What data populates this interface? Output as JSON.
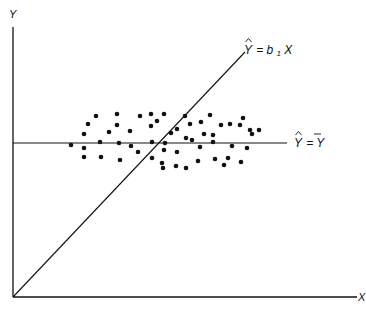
{
  "diagram": {
    "axes": {
      "y_label": "Y",
      "x_label": "X",
      "origin": [
        13,
        297
      ],
      "y_top": 27,
      "x_right": 362
    },
    "lines": [
      {
        "name": "regression-through-origin",
        "label_prefix": "Y",
        "label_eq": "= b",
        "label_sub": "1",
        "label_suffix": "X",
        "label_full": "Ŷ = b1X",
        "from": [
          13,
          297
        ],
        "to": [
          245,
          52
        ]
      },
      {
        "name": "mean-line",
        "label_prefix": "Y",
        "label_eq": "= ",
        "label_bar": "Y",
        "label_full": "Ŷ = Ȳ",
        "from": [
          13,
          143
        ],
        "to": [
          287,
          143
        ]
      }
    ],
    "stroke_color": "#111111",
    "point_color": "#111111",
    "point_radius": 2.3,
    "points": [
      [
        71,
        145
      ],
      [
        84,
        134
      ],
      [
        88,
        124
      ],
      [
        96,
        116
      ],
      [
        84,
        148
      ],
      [
        100,
        142
      ],
      [
        109,
        132
      ],
      [
        84,
        157
      ],
      [
        101,
        157
      ],
      [
        117,
        114
      ],
      [
        119,
        143
      ],
      [
        117,
        125
      ],
      [
        130,
        131
      ],
      [
        131,
        146
      ],
      [
        120,
        160
      ],
      [
        140,
        116
      ],
      [
        138,
        152
      ],
      [
        151,
        114
      ],
      [
        151,
        126
      ],
      [
        152,
        142
      ],
      [
        157,
        121
      ],
      [
        152,
        158
      ],
      [
        164,
        150
      ],
      [
        163,
        168
      ],
      [
        164,
        114
      ],
      [
        171,
        133
      ],
      [
        162,
        163
      ],
      [
        165,
        143
      ],
      [
        177,
        129
      ],
      [
        185,
        116
      ],
      [
        186,
        138
      ],
      [
        177,
        152
      ],
      [
        176,
        166
      ],
      [
        190,
        124
      ],
      [
        192,
        140
      ],
      [
        200,
        147
      ],
      [
        198,
        161
      ],
      [
        186,
        168
      ],
      [
        201,
        122
      ],
      [
        204,
        134
      ],
      [
        213,
        142
      ],
      [
        215,
        159
      ],
      [
        213,
        135
      ],
      [
        221,
        125
      ],
      [
        232,
        146
      ],
      [
        230,
        124
      ],
      [
        240,
        125
      ],
      [
        243,
        118
      ],
      [
        247,
        148
      ],
      [
        252,
        134
      ],
      [
        259,
        130
      ],
      [
        250,
        130
      ],
      [
        228,
        158
      ],
      [
        224,
        165
      ],
      [
        241,
        162
      ],
      [
        210,
        115
      ]
    ]
  }
}
